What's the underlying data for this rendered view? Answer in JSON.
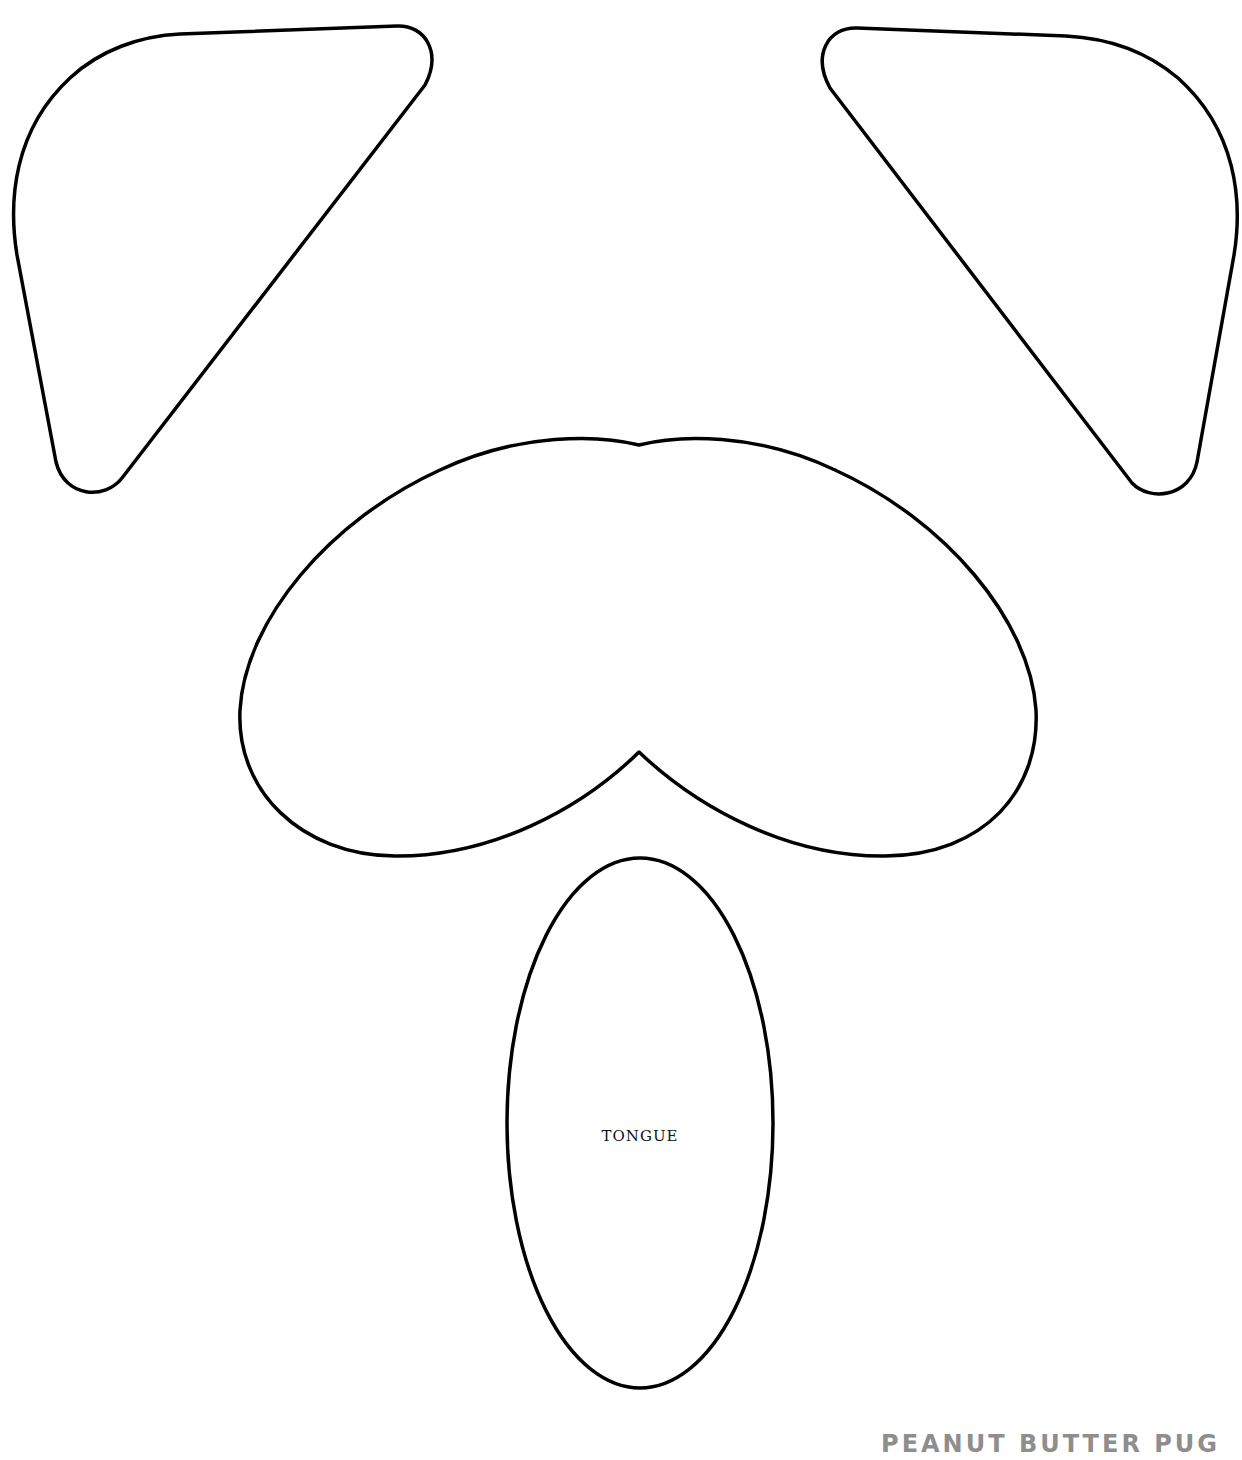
{
  "template": {
    "type": "printable cutout template",
    "stroke_color": "#000000",
    "background": "#ffffff",
    "pieces": [
      {
        "id": "left-ear",
        "label": ""
      },
      {
        "id": "right-ear",
        "label": ""
      },
      {
        "id": "muzzle",
        "label": ""
      },
      {
        "id": "tongue",
        "label": "TONGUE"
      }
    ]
  },
  "labels": {
    "tongue": "TONGUE",
    "brand": "PEANUT BUTTER PUG"
  },
  "colors": {
    "outline": "#000000",
    "brand_text": "#8e8e8e"
  }
}
